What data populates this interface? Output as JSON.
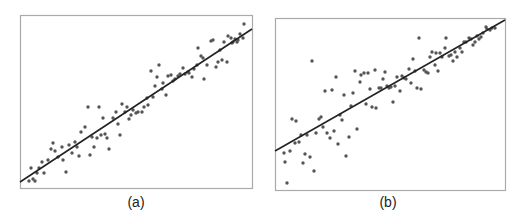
{
  "chart_data": [
    {
      "type": "scatter",
      "title": "",
      "panel_label": "(a)",
      "xlabel": "",
      "ylabel": "",
      "grid": false,
      "axes_ticks": false,
      "frame_px": {
        "left": 20,
        "top": 15,
        "right": 252,
        "bottom": 188
      },
      "fit_line_px": {
        "x1": 20,
        "y1": 182,
        "x2": 252,
        "y2": 29
      },
      "point_color": "#555555",
      "line_color": "#222222",
      "frame_color": "#aaaaaa",
      "description": "Points tightly clustered around a positive linear fit line (small residual spread)",
      "points_px": [
        [
          29,
          181
        ],
        [
          33,
          179
        ],
        [
          35,
          181
        ],
        [
          31,
          168
        ],
        [
          37,
          173
        ],
        [
          39,
          168
        ],
        [
          42,
          162
        ],
        [
          44,
          173
        ],
        [
          48,
          160
        ],
        [
          51,
          149
        ],
        [
          53,
          143
        ],
        [
          55,
          151
        ],
        [
          58,
          157
        ],
        [
          62,
          147
        ],
        [
          63,
          160
        ],
        [
          66,
          172
        ],
        [
          69,
          145
        ],
        [
          72,
          153
        ],
        [
          75,
          142
        ],
        [
          77,
          147
        ],
        [
          79,
          156
        ],
        [
          81,
          132
        ],
        [
          85,
          127
        ],
        [
          88,
          107
        ],
        [
          90,
          155
        ],
        [
          92,
          137
        ],
        [
          94,
          147
        ],
        [
          97,
          138
        ],
        [
          99,
          107
        ],
        [
          101,
          135
        ],
        [
          103,
          118
        ],
        [
          105,
          134
        ],
        [
          107,
          138
        ],
        [
          109,
          149
        ],
        [
          113,
          118
        ],
        [
          116,
          112
        ],
        [
          118,
          124
        ],
        [
          120,
          135
        ],
        [
          122,
          104
        ],
        [
          125,
          112
        ],
        [
          127,
          107
        ],
        [
          129,
          119
        ],
        [
          131,
          115
        ],
        [
          133,
          110
        ],
        [
          136,
          113
        ],
        [
          138,
          112
        ],
        [
          142,
          112
        ],
        [
          144,
          107
        ],
        [
          147,
          98
        ],
        [
          148,
          105
        ],
        [
          151,
          71
        ],
        [
          153,
          97
        ],
        [
          155,
          86
        ],
        [
          157,
          77
        ],
        [
          159,
          65
        ],
        [
          162,
          89
        ],
        [
          163,
          83
        ],
        [
          166,
          95
        ],
        [
          168,
          76
        ],
        [
          171,
          75
        ],
        [
          173,
          81
        ],
        [
          175,
          79
        ],
        [
          178,
          76
        ],
        [
          180,
          74
        ],
        [
          183,
          68
        ],
        [
          185,
          74
        ],
        [
          188,
          72
        ],
        [
          189,
          73
        ],
        [
          192,
          77
        ],
        [
          194,
          69
        ],
        [
          197,
          65
        ],
        [
          198,
          48
        ],
        [
          201,
          56
        ],
        [
          203,
          58
        ],
        [
          204,
          79
        ],
        [
          207,
          65
        ],
        [
          211,
          41
        ],
        [
          213,
          40
        ],
        [
          216,
          67
        ],
        [
          218,
          62
        ],
        [
          220,
          50
        ],
        [
          222,
          60
        ],
        [
          224,
          42
        ],
        [
          227,
          62
        ],
        [
          228,
          36
        ],
        [
          231,
          38
        ],
        [
          232,
          43
        ],
        [
          233,
          42
        ],
        [
          235,
          39
        ],
        [
          237,
          42
        ],
        [
          238,
          40
        ],
        [
          240,
          34
        ],
        [
          243,
          38
        ],
        [
          244,
          24
        ]
      ]
    },
    {
      "type": "scatter",
      "title": "",
      "panel_label": "(b)",
      "xlabel": "",
      "ylabel": "",
      "grid": false,
      "axes_ticks": false,
      "frame_px": {
        "left": 275,
        "top": 18,
        "right": 505,
        "bottom": 190
      },
      "fit_line_px": {
        "x1": 275,
        "y1": 151,
        "x2": 505,
        "y2": 20
      },
      "point_color": "#555555",
      "line_color": "#222222",
      "frame_color": "#aaaaaa",
      "description": "Points around a positive linear fit line with larger spread at low x (heteroscedastic), tightening at high x",
      "points_px": [
        [
          284,
          153
        ],
        [
          285,
          162
        ],
        [
          287,
          183
        ],
        [
          290,
          151
        ],
        [
          292,
          119
        ],
        [
          295,
          143
        ],
        [
          296,
          121
        ],
        [
          299,
          142
        ],
        [
          301,
          135
        ],
        [
          303,
          163
        ],
        [
          305,
          154
        ],
        [
          307,
          135
        ],
        [
          310,
          157
        ],
        [
          312,
          61
        ],
        [
          314,
          171
        ],
        [
          316,
          133
        ],
        [
          319,
          119
        ],
        [
          321,
          117
        ],
        [
          323,
          127
        ],
        [
          325,
          91
        ],
        [
          327,
          133
        ],
        [
          330,
          138
        ],
        [
          332,
          90
        ],
        [
          334,
          131
        ],
        [
          336,
          77
        ],
        [
          338,
          144
        ],
        [
          340,
          115
        ],
        [
          342,
          120
        ],
        [
          344,
          95
        ],
        [
          346,
          156
        ],
        [
          349,
          137
        ],
        [
          351,
          106
        ],
        [
          353,
          93
        ],
        [
          355,
          71
        ],
        [
          357,
          129
        ],
        [
          360,
          82
        ],
        [
          361,
          75
        ],
        [
          364,
          73
        ],
        [
          366,
          104
        ],
        [
          368,
          73
        ],
        [
          370,
          89
        ],
        [
          372,
          107
        ],
        [
          375,
          70
        ],
        [
          376,
          108
        ],
        [
          379,
          88
        ],
        [
          381,
          88
        ],
        [
          383,
          79
        ],
        [
          385,
          72
        ],
        [
          387,
          86
        ],
        [
          389,
          88
        ],
        [
          391,
          87
        ],
        [
          393,
          102
        ],
        [
          395,
          86
        ],
        [
          397,
          77
        ],
        [
          400,
          91
        ],
        [
          402,
          76
        ],
        [
          404,
          78
        ],
        [
          406,
          79
        ],
        [
          409,
          69
        ],
        [
          411,
          83
        ],
        [
          413,
          59
        ],
        [
          415,
          71
        ],
        [
          417,
          88
        ],
        [
          419,
          38
        ],
        [
          421,
          89
        ],
        [
          424,
          70
        ],
        [
          426,
          72
        ],
        [
          428,
          73
        ],
        [
          430,
          57
        ],
        [
          432,
          52
        ],
        [
          435,
          65
        ],
        [
          436,
          53
        ],
        [
          438,
          71
        ],
        [
          440,
          53
        ],
        [
          442,
          57
        ],
        [
          445,
          48
        ],
        [
          446,
          38
        ],
        [
          449,
          56
        ],
        [
          451,
          55
        ],
        [
          453,
          61
        ],
        [
          455,
          52
        ],
        [
          457,
          57
        ],
        [
          460,
          48
        ],
        [
          462,
          52
        ],
        [
          464,
          42
        ],
        [
          466,
          42
        ],
        [
          469,
          38
        ],
        [
          471,
          39
        ],
        [
          473,
          45
        ],
        [
          475,
          42
        ],
        [
          477,
          36
        ],
        [
          479,
          39
        ],
        [
          481,
          37
        ],
        [
          483,
          33
        ],
        [
          486,
          27
        ],
        [
          487,
          29
        ],
        [
          490,
          30
        ],
        [
          492,
          28
        ],
        [
          495,
          28
        ]
      ]
    }
  ],
  "labels": {
    "panel_a": "(a)",
    "panel_b": "(b)"
  }
}
